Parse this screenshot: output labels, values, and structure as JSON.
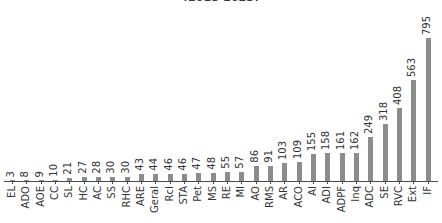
{
  "chart_data": {
    "type": "bar",
    "title": "(2018-2023)",
    "title_clipped": true,
    "xlabel": "",
    "ylabel": "",
    "ylim": [
      0,
      795
    ],
    "grid": false,
    "legend": "none",
    "orientation": "vertical",
    "bar_color": "#8c8c8c",
    "axis_color": "#4a4a4a",
    "value_labels": true,
    "value_label_rotation": 90,
    "tick_label_rotation": 90,
    "categories": [
      "EL",
      "ADO",
      "AOE",
      "CC",
      "SL",
      "HC",
      "AC",
      "SS",
      "RHC",
      "ARE",
      "Geral",
      "RcI",
      "STA",
      "Pet",
      "MS",
      "RE",
      "MI",
      "AO",
      "RMS",
      "AR",
      "ACO",
      "AI",
      "ADI",
      "ADPF",
      "Inq",
      "ADC",
      "SE",
      "RVC",
      "Ext",
      "IF"
    ],
    "values": [
      3,
      8,
      9,
      10,
      21,
      27,
      28,
      30,
      30,
      43,
      44,
      46,
      46,
      47,
      48,
      55,
      57,
      86,
      91,
      103,
      109,
      155,
      158,
      161,
      162,
      249,
      318,
      408,
      563,
      795
    ]
  }
}
